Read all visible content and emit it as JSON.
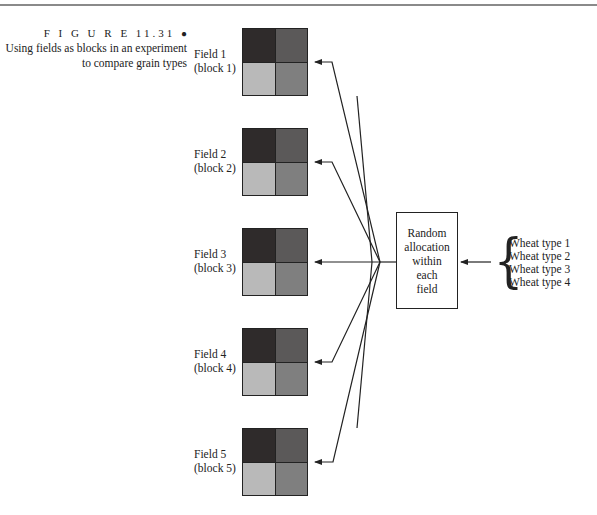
{
  "figure": {
    "label": "F I G U R E  11.31",
    "bullet": "●",
    "caption_lines": [
      "Using fields as blocks in an experiment",
      "to compare grain types"
    ]
  },
  "fields": [
    {
      "name": "Field 1",
      "block": "(block 1)"
    },
    {
      "name": "Field 2",
      "block": "(block 2)"
    },
    {
      "name": "Field 3",
      "block": "(block 3)"
    },
    {
      "name": "Field 4",
      "block": "(block 4)"
    },
    {
      "name": "Field 5",
      "block": "(block 5)"
    }
  ],
  "plot_colors": {
    "top_left": "#2f2b2b",
    "top_right": "#5b5959",
    "bottom_left": "#b9b9b9",
    "bottom_right": "#7f7f7f"
  },
  "allocation_box": {
    "lines": [
      "Random",
      "allocation",
      "within",
      "each",
      "field"
    ]
  },
  "wheat_types": [
    "Wheat type 1",
    "Wheat type 2",
    "Wheat type 3",
    "Wheat type 4"
  ]
}
